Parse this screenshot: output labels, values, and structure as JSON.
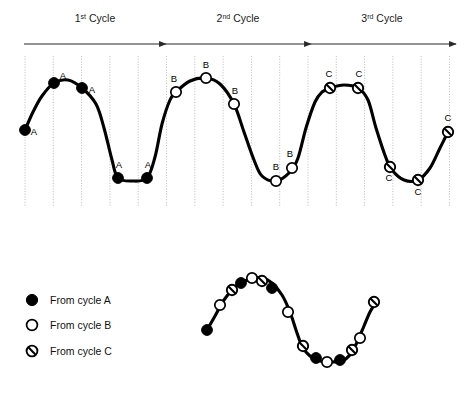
{
  "figure": {
    "title_visible": false,
    "cycle_labels": [
      {
        "name": "cycle-1-label",
        "main": "1",
        "sup": "st",
        "tail": " Cycle",
        "x": 95,
        "y": 22
      },
      {
        "name": "cycle-2-label",
        "main": "2",
        "sup": "nd",
        "tail": " Cycle",
        "x": 238,
        "y": 22
      },
      {
        "name": "cycle-3-label",
        "main": "3",
        "sup": "rd",
        "tail": " Cycle",
        "x": 382,
        "y": 22
      }
    ],
    "arrows": [
      {
        "name": "cycle-1-arrow",
        "x1": 24,
        "x2": 166,
        "y": 44
      },
      {
        "name": "cycle-2-arrow",
        "x1": 166,
        "x2": 311,
        "y": 44
      },
      {
        "name": "cycle-3-arrow",
        "x1": 311,
        "x2": 456,
        "y": 44
      }
    ],
    "grid": {
      "count": 16,
      "x_start": 25,
      "spacing": 28.3,
      "y_top": 56,
      "y_bottom": 207,
      "color": "#b9b9bd",
      "style": "dotted"
    },
    "marker_label_text": {
      "A": "A",
      "B": "B",
      "C": "C"
    }
  },
  "chart_data": {
    "type": "line",
    "xlabel": "",
    "ylabel": "",
    "grid": true,
    "legend_position": "lower-left",
    "top_plot": {
      "name": "three-cycle-waveform",
      "xlim": [
        10,
        462
      ],
      "ylim": [
        207,
        56
      ],
      "curve_points": [
        [
          25,
          130
        ],
        [
          33,
          112
        ],
        [
          42,
          96
        ],
        [
          54,
          83
        ],
        [
          68,
          80
        ],
        [
          82,
          88
        ],
        [
          96,
          104
        ],
        [
          104,
          128
        ],
        [
          112,
          160
        ],
        [
          118,
          178
        ],
        [
          132,
          181
        ],
        [
          147,
          178
        ],
        [
          155,
          157
        ],
        [
          162,
          124
        ],
        [
          170,
          100
        ],
        [
          176,
          92
        ],
        [
          190,
          81
        ],
        [
          206,
          78
        ],
        [
          220,
          84
        ],
        [
          234,
          104
        ],
        [
          244,
          132
        ],
        [
          254,
          160
        ],
        [
          262,
          176
        ],
        [
          276,
          181
        ],
        [
          290,
          172
        ],
        [
          298,
          158
        ],
        [
          306,
          128
        ],
        [
          315,
          102
        ],
        [
          322,
          92
        ],
        [
          330,
          88
        ],
        [
          344,
          85
        ],
        [
          358,
          88
        ],
        [
          368,
          100
        ],
        [
          376,
          128
        ],
        [
          386,
          158
        ],
        [
          392,
          170
        ],
        [
          404,
          180
        ],
        [
          418,
          180
        ],
        [
          430,
          168
        ],
        [
          440,
          148
        ],
        [
          448,
          132
        ]
      ],
      "series": [
        {
          "name": "From cycle A",
          "marker": "filled-circle",
          "label": "A",
          "points": [
            {
              "x": 25,
              "y": 130,
              "label_dx": 9,
              "label_dy": 5
            },
            {
              "x": 54,
              "y": 83,
              "label_dx": 9,
              "label_dy": -4
            },
            {
              "x": 82,
              "y": 88,
              "label_dx": 10,
              "label_dy": 5
            },
            {
              "x": 118,
              "y": 178,
              "label_dx": 1,
              "label_dy": -10
            },
            {
              "x": 147,
              "y": 178,
              "label_dx": 1,
              "label_dy": -10
            }
          ]
        },
        {
          "name": "From cycle B",
          "marker": "open-circle",
          "label": "B",
          "points": [
            {
              "x": 176,
              "y": 92,
              "label_dx": -2,
              "label_dy": -10
            },
            {
              "x": 206,
              "y": 78,
              "label_dx": 0,
              "label_dy": -10
            },
            {
              "x": 234,
              "y": 104,
              "label_dx": 1,
              "label_dy": -10
            },
            {
              "x": 276,
              "y": 181,
              "label_dx": 0,
              "label_dy": -11
            },
            {
              "x": 292,
              "y": 168,
              "label_dx": -2,
              "label_dy": -11
            }
          ]
        },
        {
          "name": "From cycle C",
          "marker": "hatched-circle",
          "label": "C",
          "points": [
            {
              "x": 330,
              "y": 88,
              "label_dx": -1,
              "label_dy": -11
            },
            {
              "x": 358,
              "y": 88,
              "label_dx": 1,
              "label_dy": -11
            },
            {
              "x": 390,
              "y": 167,
              "label_dx": -1,
              "label_dy": 14
            },
            {
              "x": 418,
              "y": 180,
              "label_dx": 0,
              "label_dy": 15
            },
            {
              "x": 448,
              "y": 132,
              "label_dx": 0,
              "label_dy": -11
            }
          ]
        }
      ]
    },
    "bottom_plot": {
      "name": "reconstructed-composite-waveform",
      "description": "One reconstructed cycle combining samples from cycles A, B and C",
      "curve_points": [
        [
          207,
          330
        ],
        [
          215,
          316
        ],
        [
          224,
          300
        ],
        [
          236,
          286
        ],
        [
          250,
          279
        ],
        [
          262,
          278
        ],
        [
          272,
          283
        ],
        [
          282,
          295
        ],
        [
          290,
          312
        ],
        [
          296,
          330
        ],
        [
          302,
          346
        ],
        [
          310,
          356
        ],
        [
          320,
          361
        ],
        [
          332,
          362
        ],
        [
          344,
          360
        ],
        [
          352,
          352
        ],
        [
          358,
          340
        ],
        [
          364,
          326
        ],
        [
          370,
          312
        ],
        [
          376,
          302
        ]
      ],
      "markers": [
        {
          "cycle": "A",
          "marker": "filled-circle",
          "x": 207,
          "y": 330
        },
        {
          "cycle": "B",
          "marker": "open-circle",
          "x": 220,
          "y": 305
        },
        {
          "cycle": "C",
          "marker": "hatched-circle",
          "x": 232,
          "y": 290
        },
        {
          "cycle": "A",
          "marker": "filled-circle",
          "x": 241,
          "y": 283
        },
        {
          "cycle": "B",
          "marker": "open-circle",
          "x": 252,
          "y": 278
        },
        {
          "cycle": "C",
          "marker": "hatched-circle",
          "x": 262,
          "y": 281
        },
        {
          "cycle": "A",
          "marker": "filled-circle",
          "x": 272,
          "y": 288
        },
        {
          "cycle": "B",
          "marker": "open-circle",
          "x": 288,
          "y": 312
        },
        {
          "cycle": "C",
          "marker": "hatched-circle",
          "x": 303,
          "y": 346
        },
        {
          "cycle": "A",
          "marker": "filled-circle",
          "x": 316,
          "y": 358
        },
        {
          "cycle": "B",
          "marker": "open-circle",
          "x": 327,
          "y": 362
        },
        {
          "cycle": "A",
          "marker": "filled-circle",
          "x": 340,
          "y": 360
        },
        {
          "cycle": "C",
          "marker": "hatched-circle",
          "x": 352,
          "y": 350
        },
        {
          "cycle": "B",
          "marker": "open-circle",
          "x": 360,
          "y": 338
        },
        {
          "cycle": "C",
          "marker": "hatched-circle",
          "x": 374,
          "y": 302
        }
      ]
    }
  },
  "legend": {
    "name": "marker-legend",
    "items": [
      {
        "label": "From cycle A",
        "marker": "filled-circle",
        "x": 32,
        "y": 300
      },
      {
        "label": "From cycle B",
        "marker": "open-circle",
        "x": 32,
        "y": 325
      },
      {
        "label": "From cycle C",
        "marker": "hatched-circle",
        "x": 32,
        "y": 351
      }
    ],
    "text_x": 50
  },
  "colors": {
    "curve": "#000000",
    "grid": "#b9b9bd",
    "axis": "#2a2a2a",
    "marker_fill_a": "#000000",
    "marker_fill_b": "#ffffff",
    "background": "#ffffff"
  }
}
